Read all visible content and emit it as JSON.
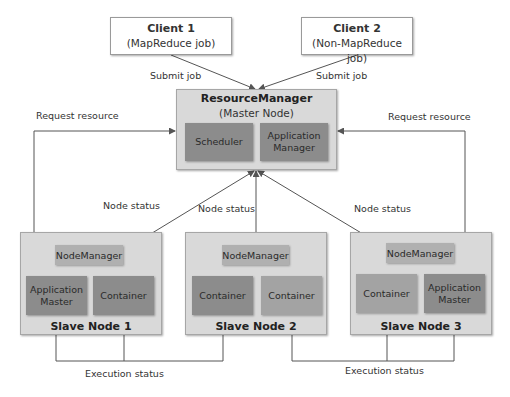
{
  "clients": [
    {
      "name": "Client 1",
      "job": "(MapReduce job)",
      "edge_label": "Submit job"
    },
    {
      "name": "Client 2",
      "job": "(Non-MapReduce job)",
      "edge_label": "Submit job"
    }
  ],
  "resource_manager": {
    "title": "ResourceManager",
    "subtitle": "(Master Node)",
    "components": [
      "Scheduler",
      "Application Manager"
    ]
  },
  "request_labels": [
    "Request resource",
    "Request resource"
  ],
  "node_status_labels": [
    "Node status",
    "Node status",
    "Node status"
  ],
  "slave_nodes": [
    {
      "name": "Slave Node 1",
      "node_manager": "NodeManager",
      "left": "Application Master",
      "right": "Container"
    },
    {
      "name": "Slave Node 2",
      "node_manager": "NodeManager",
      "left": "Container",
      "right": "Container"
    },
    {
      "name": "Slave Node 3",
      "node_manager": "NodeManager",
      "left": "Container",
      "right": "Application Master"
    }
  ],
  "execution_labels": [
    "Execution status",
    "Execution status"
  ],
  "colors": {
    "outer_box": "#d9d9d9",
    "dark_component": "#8c8c8c",
    "mid_component": "#a3a3a3",
    "node_manager": "#b0b0b0",
    "line": "#555555"
  }
}
